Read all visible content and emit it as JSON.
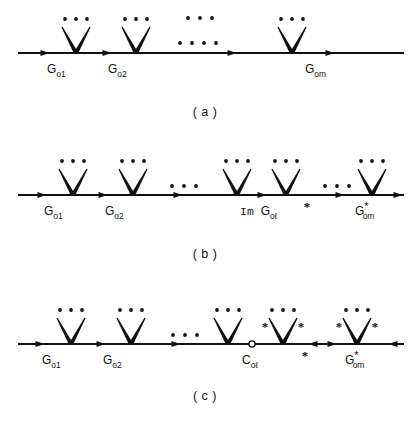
{
  "figure": {
    "width": 420,
    "height": 423,
    "ink_color": "#111111",
    "background_color": "#ffffff"
  },
  "panels": [
    {
      "id": "panel-a",
      "caption": "( a )",
      "caption_x": 205,
      "caption_y": 116,
      "baseline_y": 53,
      "line_start_x": 18,
      "line_end_x": 404,
      "vertices": [
        {
          "id": "v-a-1",
          "x": 76,
          "y": 53,
          "kind": "filled",
          "leg_marks": []
        },
        {
          "id": "v-a-2",
          "x": 136,
          "y": 53,
          "kind": "filled",
          "leg_marks": []
        },
        {
          "id": "v-a-3",
          "x": 292,
          "y": 53,
          "kind": "filled",
          "leg_marks": []
        }
      ],
      "line_arrows": [
        {
          "x": 45,
          "dir": "right"
        },
        {
          "x": 107,
          "dir": "right"
        },
        {
          "x": 232,
          "dir": "right"
        },
        {
          "x": 330,
          "dir": "right"
        }
      ],
      "ellipses": [
        {
          "id": "ell-a-top",
          "x": 188,
          "y": 18,
          "count": 3,
          "gap": 12,
          "r": 1.9
        },
        {
          "id": "ell-a-mid",
          "x": 180,
          "y": 43,
          "count": 4,
          "gap": 12,
          "r": 1.9
        }
      ],
      "labels": [
        {
          "id": "lbl-a-1",
          "base": "G",
          "sub": "o1",
          "sup": "",
          "x": 47,
          "y": 73
        },
        {
          "id": "lbl-a-2",
          "base": "G",
          "sub": "o2",
          "sup": "",
          "x": 108,
          "y": 73
        },
        {
          "id": "lbl-a-3",
          "base": "G",
          "sub": "om",
          "sup": "",
          "x": 305,
          "y": 73
        }
      ],
      "baseline_stars": []
    },
    {
      "id": "panel-b",
      "caption": "( b )",
      "caption_x": 205,
      "caption_y": 258,
      "baseline_y": 195,
      "line_start_x": 18,
      "line_end_x": 404,
      "vertices": [
        {
          "id": "v-b-1",
          "x": 73,
          "y": 195,
          "kind": "filled",
          "leg_marks": []
        },
        {
          "id": "v-b-2",
          "x": 133,
          "y": 195,
          "kind": "filled",
          "leg_marks": []
        },
        {
          "id": "v-b-3",
          "x": 237,
          "y": 195,
          "kind": "filled",
          "leg_marks": []
        },
        {
          "id": "v-b-4",
          "x": 286,
          "y": 195,
          "kind": "filled",
          "leg_marks": []
        },
        {
          "id": "v-b-5",
          "x": 372,
          "y": 195,
          "kind": "filled",
          "leg_marks": []
        }
      ],
      "line_arrows": [
        {
          "x": 42,
          "dir": "right"
        },
        {
          "x": 103,
          "dir": "right"
        },
        {
          "x": 178,
          "dir": "right"
        },
        {
          "x": 262,
          "dir": "right"
        },
        {
          "x": 340,
          "dir": "right"
        },
        {
          "x": 398,
          "dir": "right"
        }
      ],
      "ellipses": [
        {
          "id": "ell-b-mid",
          "x": 172,
          "y": 186,
          "count": 3,
          "gap": 12,
          "r": 1.9
        },
        {
          "id": "ell-b-right",
          "x": 325,
          "y": 186,
          "count": 3,
          "gap": 12,
          "r": 1.9
        }
      ],
      "labels": [
        {
          "id": "lbl-b-1",
          "base": "G",
          "sub": "o1",
          "sup": "",
          "x": 44,
          "y": 215
        },
        {
          "id": "lbl-b-2",
          "base": "G",
          "sub": "o2",
          "sup": "",
          "x": 105,
          "y": 215
        },
        {
          "id": "lbl-b-3",
          "base": "G",
          "sub": "oℓ",
          "sup": "",
          "x": 240,
          "y": 215,
          "prefix": "Im "
        },
        {
          "id": "lbl-b-4",
          "base": "G",
          "sub": "om",
          "sup": "*",
          "x": 355,
          "y": 215
        }
      ],
      "baseline_stars": [
        {
          "id": "star-b-line",
          "x": 307,
          "y": 211
        }
      ]
    },
    {
      "id": "panel-c",
      "caption": "( c )",
      "caption_x": 205,
      "caption_y": 400,
      "baseline_y": 344,
      "line_start_x": 18,
      "line_end_x": 404,
      "vertices": [
        {
          "id": "v-c-1",
          "x": 71,
          "y": 344,
          "kind": "filled",
          "leg_marks": []
        },
        {
          "id": "v-c-2",
          "x": 131,
          "y": 344,
          "kind": "filled",
          "leg_marks": []
        },
        {
          "id": "v-c-3",
          "x": 228,
          "y": 344,
          "kind": "filled",
          "leg_marks": []
        },
        {
          "id": "v-c-4",
          "x": 283,
          "y": 344,
          "kind": "filled",
          "leg_marks": [
            "*",
            "*"
          ]
        },
        {
          "id": "v-c-5",
          "x": 357,
          "y": 344,
          "kind": "filled",
          "leg_marks": [
            "*",
            "*"
          ]
        }
      ],
      "open_vertices": [
        {
          "id": "openv-c",
          "x": 252,
          "y": 344,
          "r": 3.1
        }
      ],
      "line_arrows": [
        {
          "x": 40,
          "dir": "right"
        },
        {
          "x": 101,
          "dir": "right"
        },
        {
          "x": 176,
          "dir": "right"
        },
        {
          "x": 313,
          "dir": "left"
        },
        {
          "x": 332,
          "dir": "right"
        },
        {
          "x": 393,
          "dir": "left"
        }
      ],
      "ellipses": [
        {
          "id": "ell-c-mid",
          "x": 173,
          "y": 335,
          "count": 3,
          "gap": 12,
          "r": 1.9
        }
      ],
      "labels": [
        {
          "id": "lbl-c-1",
          "base": "G",
          "sub": "o1",
          "sup": "",
          "x": 42,
          "y": 364
        },
        {
          "id": "lbl-c-2",
          "base": "G",
          "sub": "o2",
          "sup": "",
          "x": 103,
          "y": 364
        },
        {
          "id": "lbl-c-3",
          "base": "C",
          "sub": "oℓ",
          "sup": "",
          "x": 242,
          "y": 364
        },
        {
          "id": "lbl-c-4",
          "base": "G",
          "sub": "om",
          "sup": "*",
          "x": 345,
          "y": 364
        }
      ],
      "baseline_stars": [
        {
          "id": "star-c-line",
          "x": 305,
          "y": 360
        }
      ]
    }
  ],
  "vertex_geometry": {
    "leg_length": 26,
    "leg_spread": 14,
    "leg_stroke_thick": 4.2,
    "leg_stroke_thin": 1.3,
    "dots_above_offset": 34,
    "dots_count": 3,
    "dots_gap": 11,
    "dots_radius": 1.9,
    "arrow_half_width": 3.1,
    "arrow_length": 9
  }
}
